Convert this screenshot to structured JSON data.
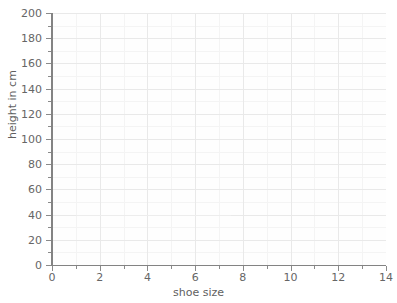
{
  "chart_data": {
    "type": "scatter",
    "title": "",
    "subtitle": "",
    "xlabel": "shoe size",
    "ylabel": "height in cm",
    "xlim": [
      0,
      14
    ],
    "ylim": [
      0,
      200
    ],
    "x_major_ticks": [
      0,
      2,
      4,
      6,
      8,
      10,
      12,
      14
    ],
    "x_minor_ticks": [
      1,
      3,
      5,
      7,
      9,
      11,
      13
    ],
    "y_major_ticks": [
      0,
      20,
      40,
      60,
      80,
      100,
      120,
      140,
      160,
      180,
      200
    ],
    "y_minor_ticks": [
      10,
      30,
      50,
      70,
      90,
      110,
      130,
      150,
      170,
      190
    ],
    "x_tick_labels": [
      "0",
      "2",
      "4",
      "6",
      "8",
      "10",
      "12",
      "14"
    ],
    "y_tick_labels": [
      "0",
      "20",
      "40",
      "60",
      "80",
      "100",
      "120",
      "140",
      "160",
      "180",
      "200"
    ],
    "grid": true,
    "grid_minor": true,
    "legend": false,
    "legend_position": "none",
    "series": [
      {
        "name": "",
        "x": [],
        "values": []
      }
    ],
    "annotations": [
      {
        "name": "faint-baseline-artifact",
        "y": 40,
        "x_start": 1.0,
        "x_end": 7.5
      }
    ]
  },
  "colors": {
    "background": "#ffffff",
    "plot_background": "#fefefe",
    "axis_line": "#838383",
    "tick_mark": "#8a8a8a",
    "tick_label": "#666666",
    "axis_title": "#5f5f5f",
    "grid_major": "#e9e9e9",
    "grid_minor": "#f4f4f4",
    "artifact_line": "#ededed"
  }
}
